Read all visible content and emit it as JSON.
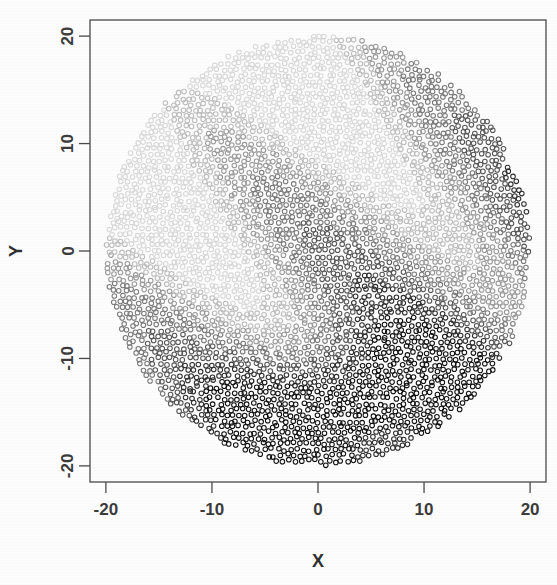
{
  "figure": {
    "title": "",
    "background_color": "#fdfdfd",
    "frame_color": "#4a4a4a"
  },
  "axes": {
    "x_title": "X",
    "y_title": "Y",
    "x_ticks": [
      "-20",
      "-10",
      "0",
      "10",
      "20"
    ],
    "y_ticks": [
      "-20",
      "-10",
      "0",
      "10",
      "20"
    ],
    "x_tick_values": [
      -20,
      -10,
      0,
      10,
      20
    ],
    "y_tick_values": [
      -20,
      -10,
      0,
      10,
      20
    ],
    "xlim": [
      -21.5,
      21.5
    ],
    "ylim": [
      -21.5,
      21.5
    ]
  },
  "chart_data": {
    "type": "scatter",
    "title": "",
    "xlabel": "X",
    "ylabel": "Y",
    "xlim": [
      -21.5,
      21.5
    ],
    "ylim": [
      -21.5,
      21.5
    ],
    "x_ticks": [
      -20,
      -10,
      0,
      10,
      20
    ],
    "y_ticks": [
      -20,
      -10,
      0,
      10,
      20
    ],
    "grid": false,
    "legend": "none",
    "marker": "open-circle",
    "marker_size_px": 4.6,
    "domain": {
      "shape": "disc",
      "center_x": 0,
      "center_y": 0,
      "radius": 20
    },
    "n_points": 3600,
    "encoding": "greyscale shading of a continuous spatial field; light grey = low value, black = high value",
    "grey_levels": [
      "#d8d8d8",
      "#bdbdbd",
      "#9a9a9a",
      "#7a7a7a",
      "#565656",
      "#2e2e2e",
      "#111111"
    ],
    "field_model": {
      "description": "anisotropic diagonal wave plus a strong high-value lobe near the lower-centre of the disc",
      "wave_direction_deg": 35,
      "wave_wavelength": 17.5,
      "wave_amplitude": 0.42,
      "trend_gradient": "increases toward lower-right",
      "hotspot": {
        "x": 2.5,
        "y": -14.0,
        "sx": 11.0,
        "sy": 5.5,
        "strength": 0.95
      }
    },
    "observed_bands": [
      {
        "label": "light band (upper-left region)",
        "approx_value": 0.12
      },
      {
        "label": "mid-grey diagonal band from (-20,0) to (10,17)",
        "approx_value": 0.45
      },
      {
        "label": "mid-grey diagonal band from (-18,-9) to (8,3)",
        "approx_value": 0.5
      },
      {
        "label": "dark diagonal band upper-right near (14,8)",
        "approx_value": 0.72
      },
      {
        "label": "darkest lobe near (2,-14)",
        "approx_value": 0.97
      }
    ]
  }
}
